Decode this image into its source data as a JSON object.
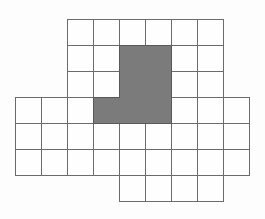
{
  "figure": {
    "background_color": "#fdfdfd",
    "grid_line_color": "#6b6b6b",
    "cell_fill_color": "#fefefe",
    "shaded_fill_color": "#7b7b7b",
    "shaded_edge_color": "#585858",
    "cell_size_px": 26,
    "origin_px": {
      "x": 15,
      "y": 19
    },
    "grid_rows": [
      {
        "row": 1,
        "col_start": 3,
        "col_end": 8
      },
      {
        "row": 2,
        "col_start": 3,
        "col_end": 8
      },
      {
        "row": 3,
        "col_start": 3,
        "col_end": 8
      },
      {
        "row": 4,
        "col_start": 1,
        "col_end": 9
      },
      {
        "row": 5,
        "col_start": 1,
        "col_end": 9
      },
      {
        "row": 6,
        "col_start": 1,
        "col_end": 9
      },
      {
        "row": 7,
        "col_start": 5,
        "col_end": 8
      }
    ],
    "shaded_cells": [
      {
        "row": 2,
        "col": 5
      },
      {
        "row": 2,
        "col": 6
      },
      {
        "row": 3,
        "col": 5
      },
      {
        "row": 3,
        "col": 6
      },
      {
        "row": 4,
        "col": 4
      },
      {
        "row": 4,
        "col": 5
      },
      {
        "row": 4,
        "col": 6
      }
    ],
    "shaded_region_outline_grid_units": [
      [
        4,
        1
      ],
      [
        6,
        1
      ],
      [
        6,
        4
      ],
      [
        3,
        4
      ],
      [
        3,
        3
      ],
      [
        4,
        3
      ]
    ]
  }
}
